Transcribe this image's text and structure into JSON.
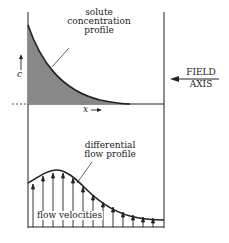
{
  "diagram": {
    "labels": {
      "solute_line1": "solute",
      "solute_line2": "concentration",
      "solute_line3": "profile",
      "c_axis": "c",
      "x_axis": "x",
      "field_line1": "FIELD",
      "field_line2": "AXIS",
      "diff_line1": "differential",
      "diff_line2": "flow profile",
      "flow_velocities": "flow velocities"
    },
    "colors": {
      "stroke": "#222222",
      "fill": "#888888"
    }
  }
}
